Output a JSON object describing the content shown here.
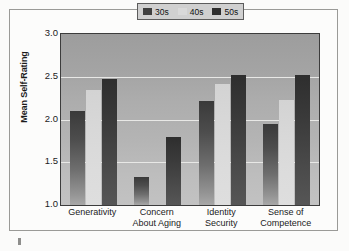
{
  "chart_data": {
    "type": "bar",
    "title": "",
    "xlabel": "",
    "ylabel": "Mean Self-Rating",
    "ylim": [
      1.0,
      3.0
    ],
    "yticks": [
      "1.0",
      "1.5",
      "2.0",
      "2.5",
      "3.0"
    ],
    "ytick_values": [
      1.0,
      1.5,
      2.0,
      2.5,
      3.0
    ],
    "grid": true,
    "legend_position": "top-right",
    "categories": [
      "Generativity",
      "Concern About Aging",
      "Identity Security",
      "Sense of Competence"
    ],
    "category_lines": [
      [
        "Generativity"
      ],
      [
        "Concern",
        "About Aging"
      ],
      [
        "Identity",
        "Security"
      ],
      [
        "Sense of",
        "Competence"
      ]
    ],
    "series": [
      {
        "name": "30s",
        "color": "#3f3f3f",
        "values": [
          2.1,
          1.33,
          2.22,
          1.95
        ]
      },
      {
        "name": "40s",
        "color": "#d9d9d9",
        "values": [
          2.34,
          1.0,
          2.42,
          2.23
        ]
      },
      {
        "name": "50s",
        "color": "#2f2f2f",
        "values": [
          2.47,
          1.8,
          2.52,
          2.52
        ]
      }
    ]
  },
  "legend": {
    "entries": [
      {
        "label": "30s"
      },
      {
        "label": "40s"
      },
      {
        "label": "50s"
      }
    ]
  }
}
